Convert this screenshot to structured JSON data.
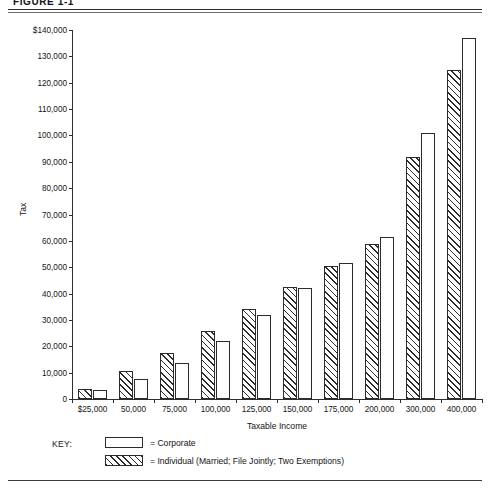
{
  "figure": {
    "title": "FIGURE 1-1"
  },
  "legend": {
    "key_label": "KEY:",
    "entries": [
      {
        "swatch": "white-box",
        "text": "= Corporate"
      },
      {
        "swatch": "hatched-box",
        "text": "= Individual (Married; File Jointly; Two Exemptions)"
      }
    ]
  },
  "chart_data": {
    "type": "bar",
    "title": "FIGURE 1-1",
    "xlabel": "Taxable Income",
    "ylabel": "Tax",
    "ylim": [
      0,
      140000
    ],
    "ytick_step": 10000,
    "grid": false,
    "legend_position": "below-plot-left",
    "categories": [
      "$25,000",
      "50,000",
      "75,000",
      "100,000",
      "125,000",
      "150,000",
      "175,000",
      "200,000",
      "300,000",
      "400,000"
    ],
    "ytick_labels": [
      "0",
      "10,000",
      "20,000",
      "30,000",
      "40,000",
      "50,000",
      "60,000",
      "70,000",
      "80,000",
      "90,000",
      "100,000",
      "110,000",
      "120,000",
      "130,000",
      "$140,000"
    ],
    "series": [
      {
        "name": "Individual (Married; File Jointly; Two Exemptions)",
        "style": "hatched",
        "values": [
          3800,
          10500,
          17500,
          25800,
          34000,
          42500,
          50500,
          59000,
          92000,
          125000
        ]
      },
      {
        "name": "Corporate",
        "style": "white",
        "values": [
          3300,
          7500,
          13750,
          22000,
          32000,
          42000,
          51500,
          61500,
          101000,
          137000
        ]
      }
    ]
  },
  "colors": {
    "ink": "#2b2b2b",
    "bar_fill": "#ffffff",
    "background": "#ffffff"
  }
}
